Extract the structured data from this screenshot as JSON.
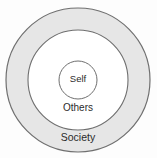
{
  "diagram": {
    "type": "concentric-circles",
    "background_color": "#fdfdfd",
    "width": 157,
    "height": 158,
    "center": {
      "x": 78,
      "y": 80
    },
    "rings": [
      {
        "id": "society",
        "label": "Society",
        "level": 3,
        "radius": 72,
        "fill_color": "#e6e6e6",
        "stroke_color": "#6f6f6f",
        "stroke_width": 1.2,
        "label_x": 78,
        "label_y": 138
      },
      {
        "id": "others",
        "label": "Others",
        "level": 2,
        "radius": 50,
        "fill_color": "#ffffff",
        "stroke_color": "#6f6f6f",
        "stroke_width": 1.1,
        "label_x": 78,
        "label_y": 108
      },
      {
        "id": "self",
        "label": "Self",
        "level": 1,
        "radius": 19,
        "fill_color": "#ffffff",
        "stroke_color": "#6f6f6f",
        "stroke_width": 1.0,
        "label_x": 78,
        "label_y": 79
      }
    ]
  }
}
